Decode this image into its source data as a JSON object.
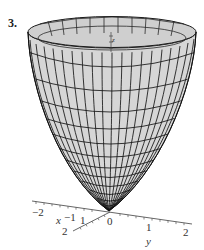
{
  "figure": {
    "number_label": "3.",
    "surface_fill": "#d9d9d9",
    "mesh_color": "#1a1a1a",
    "axis_color": "#555555"
  },
  "axes": {
    "x": {
      "label": "x",
      "ticks": [
        "−1",
        "1",
        "2"
      ]
    },
    "y": {
      "label": "y",
      "ticks": [
        "−2",
        "0",
        "1",
        "2"
      ]
    },
    "z": {
      "label": "z"
    }
  }
}
